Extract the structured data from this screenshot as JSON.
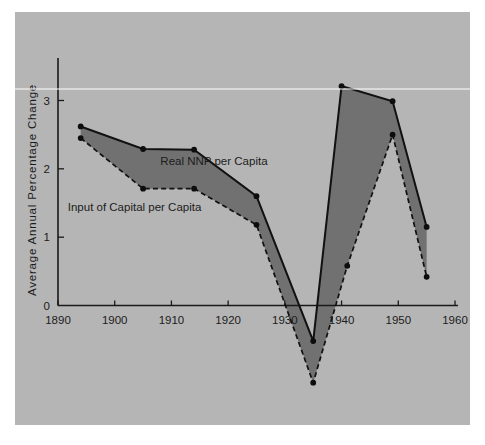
{
  "chart_data": {
    "type": "line",
    "title": "",
    "subtitle": "",
    "xlabel": "",
    "ylabel": "Average  Annual  Percentage  Change",
    "xlim": [
      1890,
      1960
    ],
    "ylim": [
      -1.3,
      3.6
    ],
    "xticks": [
      1890,
      1900,
      1910,
      1920,
      1930,
      1940,
      1950,
      1960
    ],
    "xtick_labels": [
      "1890",
      "1900",
      "1910",
      "1920",
      "1930",
      "1940",
      "1950",
      "1960"
    ],
    "yticks": [
      0,
      1,
      2,
      3
    ],
    "ytick_labels": [
      "0",
      "1",
      "2",
      "3"
    ],
    "grid": false,
    "legend_position": "inline-annotation",
    "series": [
      {
        "name": "Real NNP per Capita",
        "style": "solid",
        "x": [
          1894,
          1905,
          1914,
          1925,
          1935,
          1940,
          1949,
          1955
        ],
        "values": [
          2.62,
          2.29,
          2.28,
          1.6,
          -0.52,
          3.21,
          2.99,
          1.15
        ]
      },
      {
        "name": "Input of Capital per Capita",
        "style": "dashed",
        "x": [
          1894,
          1905,
          1914,
          1925,
          1935,
          1941,
          1949,
          1955
        ],
        "values": [
          2.45,
          1.71,
          1.71,
          1.18,
          -1.13,
          0.58,
          2.5,
          0.42
        ]
      }
    ],
    "annotations": [
      {
        "text": "Real NNP per Capita",
        "x": 1917.5,
        "y": 2.05
      },
      {
        "text": "Input of Capital per Capita",
        "x": 1903.5,
        "y": 1.38
      }
    ],
    "shaded_between_series": true,
    "colors": {
      "band_fill": "#6e6e6e",
      "line": "#111111",
      "panel_background": "#b5b5b5",
      "page_background": "#ffffff",
      "text": "#1c1c1c"
    }
  }
}
